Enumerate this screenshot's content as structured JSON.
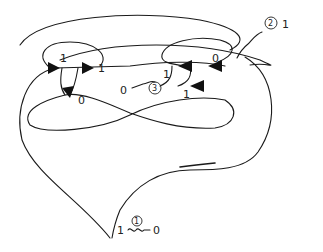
{
  "diagram": {
    "type": "hand-drawn knot diagram with crossing change labels",
    "crossing_labels": {
      "top_left_upper": "1",
      "top_left_right": "1",
      "top_left_lower": "0",
      "top_right_upper": "0",
      "top_right_left": "1",
      "top_right_lower": "1"
    },
    "moves": [
      {
        "id": "1",
        "from": "1",
        "to": "0",
        "position": "bottom"
      },
      {
        "id": "2",
        "from": "",
        "to": "1",
        "position": "top-right"
      },
      {
        "id": "3",
        "from": "",
        "to": "0",
        "position": "center"
      }
    ],
    "colors": {
      "ink": "#1a1a1a",
      "background": "#ffffff"
    }
  }
}
